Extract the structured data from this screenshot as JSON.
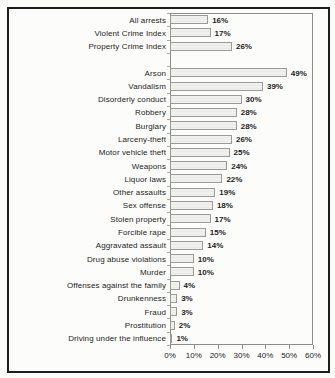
{
  "page": {
    "background": "#fbfbf8",
    "frame_border_color": "#1e1e1e"
  },
  "chart_data": {
    "type": "bar",
    "orientation": "horizontal",
    "title": "",
    "categories": [
      "All arrests",
      "Violent Crime Index",
      "Property Crime Index",
      "Arson",
      "Vandalism",
      "Disorderly conduct",
      "Robbery",
      "Burglary",
      "Larceny-theft",
      "Motor vehicle theft",
      "Weapons",
      "Liquor laws",
      "Other assaults",
      "Sex offense",
      "Stolen property",
      "Forcible rape",
      "Aggravated assault",
      "Drug abuse violations",
      "Murder",
      "Offenses against the family",
      "Drunkenness",
      "Fraud",
      "Prostitution",
      "Driving under the influence"
    ],
    "values": [
      16,
      17,
      26,
      49,
      39,
      30,
      28,
      28,
      26,
      25,
      24,
      22,
      19,
      18,
      17,
      15,
      14,
      10,
      10,
      4,
      3,
      3,
      2,
      1
    ],
    "value_labels": [
      "16%",
      "17%",
      "26%",
      "49%",
      "39%",
      "30%",
      "28%",
      "28%",
      "26%",
      "25%",
      "24%",
      "22%",
      "19%",
      "18%",
      "17%",
      "15%",
      "14%",
      "10%",
      "10%",
      "4%",
      "3%",
      "3%",
      "2%",
      "1%"
    ],
    "x_tick_labels": [
      "0%",
      "10%",
      "20%",
      "30%",
      "40%",
      "50%",
      "60%"
    ],
    "xlim": [
      0,
      60
    ],
    "gap_after_index": 2,
    "grid": false,
    "legend": false,
    "bar_fill": "#f0f0ed",
    "bar_border": "#9a9a96",
    "axis_color": "#8d8d89",
    "text_color": "#1c1c1c"
  }
}
